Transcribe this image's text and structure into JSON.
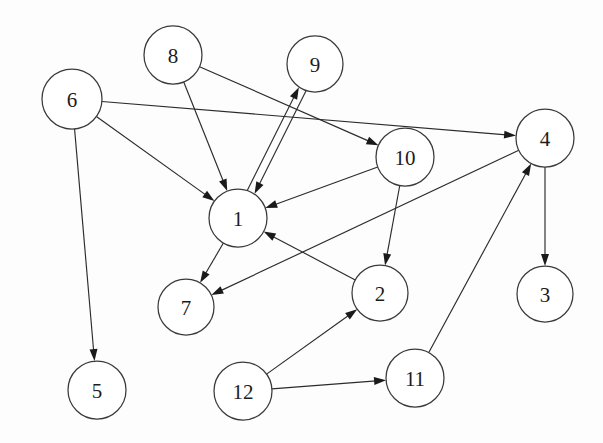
{
  "diagram": {
    "type": "directed-graph",
    "background_color": "#fdfdfd",
    "node_fill_color": "#ffffff",
    "node_stroke_color": "#3a3a3a",
    "edge_color": "#2b2b2b",
    "label_color": "#1c1c1c",
    "node_radius": 28,
    "nodes": [
      {
        "id": "1",
        "label": "1",
        "cx": 238,
        "cy": 218,
        "r": 29
      },
      {
        "id": "2",
        "label": "2",
        "cx": 380,
        "cy": 293,
        "r": 28
      },
      {
        "id": "3",
        "label": "3",
        "cx": 545,
        "cy": 294,
        "r": 28
      },
      {
        "id": "4",
        "label": "4",
        "cx": 545,
        "cy": 138,
        "r": 29
      },
      {
        "id": "5",
        "label": "5",
        "cx": 97,
        "cy": 390,
        "r": 29
      },
      {
        "id": "6",
        "label": "6",
        "cx": 72,
        "cy": 99,
        "r": 30
      },
      {
        "id": "7",
        "label": "7",
        "cx": 186,
        "cy": 307,
        "r": 28
      },
      {
        "id": "8",
        "label": "8",
        "cx": 173,
        "cy": 55,
        "r": 29
      },
      {
        "id": "9",
        "label": "9",
        "cx": 315,
        "cy": 64,
        "r": 28
      },
      {
        "id": "10",
        "label": "10",
        "cx": 405,
        "cy": 157,
        "r": 29
      },
      {
        "id": "11",
        "label": "11",
        "cx": 415,
        "cy": 378,
        "r": 29
      },
      {
        "id": "12",
        "label": "12",
        "cx": 243,
        "cy": 391,
        "r": 29
      }
    ],
    "edges": [
      {
        "from": "6",
        "to": "4",
        "offset": 0
      },
      {
        "from": "6",
        "to": "1",
        "offset": 0
      },
      {
        "from": "6",
        "to": "5",
        "offset": 0
      },
      {
        "from": "8",
        "to": "1",
        "offset": 0
      },
      {
        "from": "8",
        "to": "10",
        "offset": 0
      },
      {
        "from": "1",
        "to": "9",
        "offset": -4
      },
      {
        "from": "9",
        "to": "1",
        "offset": -4
      },
      {
        "from": "1",
        "to": "7",
        "offset": 0
      },
      {
        "from": "10",
        "to": "1",
        "offset": 0
      },
      {
        "from": "10",
        "to": "2",
        "offset": 0
      },
      {
        "from": "2",
        "to": "1",
        "offset": 0
      },
      {
        "from": "4",
        "to": "7",
        "offset": 0
      },
      {
        "from": "4",
        "to": "3",
        "offset": 0
      },
      {
        "from": "11",
        "to": "4",
        "offset": 0
      },
      {
        "from": "12",
        "to": "2",
        "offset": 0
      },
      {
        "from": "12",
        "to": "11",
        "offset": 0
      }
    ]
  }
}
